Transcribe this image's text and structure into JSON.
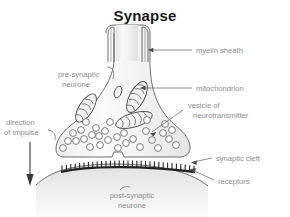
{
  "figure": {
    "title": "Synapse",
    "width": 290,
    "height": 217,
    "background_color": "#ffffff",
    "label_color": "#8d8d8d",
    "outline_color": "#5d5d5d",
    "title_color": "#1a1a1a",
    "membrane_color": "#262626"
  },
  "labels": {
    "myelin_sheath": "myelin sheath",
    "pre_synaptic_line1": "pre-synaptic",
    "pre_synaptic_line2": "neurone",
    "mitochondrion": "mitochondrion",
    "vesicle_line1": "vesicle of",
    "vesicle_line2": "neurotransmitter",
    "direction_line1": "direction",
    "direction_line2": "of impulse",
    "synaptic_cleft": "synaptic cleft",
    "receptors": "receptors",
    "post_synaptic_line1": "post-synaptic",
    "post_synaptic_line2": "neurone"
  },
  "structures": {
    "mitochondria_count": 4,
    "vesicle_count": 30,
    "receptor_teeth_count": 31,
    "myelin_line_pairs": 2,
    "impulse_arrow_direction": "down"
  },
  "diagram_data": {
    "type": "labelled-biological-diagram",
    "subject": "chemical synapse between two neurones",
    "parts": [
      "myelin sheath",
      "pre-synaptic neurone",
      "mitochondrion",
      "vesicle of neurotransmitter",
      "synaptic cleft",
      "receptors",
      "post-synaptic neurone"
    ]
  }
}
